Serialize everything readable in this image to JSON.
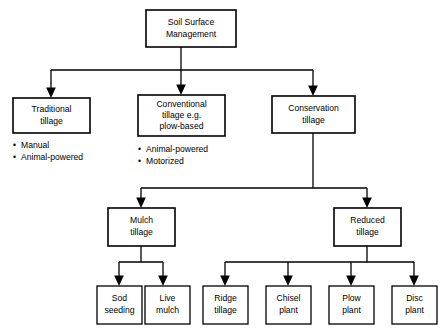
{
  "diagram": {
    "type": "hierarchy-flowchart",
    "colors": {
      "background": "#ffffff",
      "box_fill": "#ffffff",
      "line": "#000000",
      "text": "#000000"
    },
    "bullet_glyph": "•",
    "nodes": {
      "root": {
        "label_line1": "Soil Surface",
        "label_line2": "Management"
      },
      "traditional": {
        "label_line1": "Traditional",
        "label_line2": "tillage",
        "bullets": [
          "Manual",
          "Animal-powered"
        ]
      },
      "conventional": {
        "label_line1": "Conventional",
        "label_line2": "tillage e.g.",
        "label_line3": "plow-based",
        "bullets": [
          "Animal-powered",
          "Motorized"
        ]
      },
      "conservation": {
        "label_line1": "Conservation",
        "label_line2": "tillage"
      },
      "mulch": {
        "label_line1": "Mulch",
        "label_line2": "tillage"
      },
      "reduced": {
        "label_line1": "Reduced",
        "label_line2": "tillage"
      },
      "sod_seeding": {
        "label_line1": "Sod",
        "label_line2": "seeding"
      },
      "live_mulch": {
        "label_line1": "Live",
        "label_line2": "mulch"
      },
      "ridge_tillage": {
        "label_line1": "Ridge",
        "label_line2": "tillage"
      },
      "chisel_plant": {
        "label_line1": "Chisel",
        "label_line2": "plant"
      },
      "plow_plant": {
        "label_line1": "Plow",
        "label_line2": "plant"
      },
      "disc_plant": {
        "label_line1": "Disc",
        "label_line2": "plant"
      }
    }
  }
}
